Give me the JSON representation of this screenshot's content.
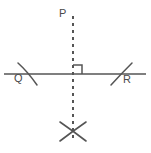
{
  "figure": {
    "background_color": "#ffffff",
    "stroke_color": "#555555",
    "label_color": "#4a4a4a",
    "width": 151,
    "height": 153
  },
  "labels": {
    "point_p": "P",
    "point_q": "Q",
    "point_r": "R"
  },
  "geometry": {
    "base_line": {
      "name": "horizontal-line",
      "x1": 4,
      "y1": 74,
      "x2": 146,
      "y2": 74,
      "style": "solid"
    },
    "perpendicular_line": {
      "name": "vertical-dashed-line",
      "x1": 73,
      "y1": 16,
      "x2": 73,
      "y2": 140,
      "style": "dashed",
      "dash_pattern": "3 4"
    },
    "right_angle_marker": {
      "name": "right-angle-square",
      "x": 73,
      "y": 74,
      "size": 9,
      "orientation": "upper-right"
    },
    "arc_q": {
      "name": "arc-mark-q",
      "x1": 18,
      "y1": 64,
      "x2": 36,
      "y2": 84
    },
    "arc_r": {
      "name": "arc-mark-r",
      "x1": 112,
      "y1": 84,
      "x2": 132,
      "y2": 64
    },
    "cross_arcs": {
      "name": "intersection-cross",
      "arc_a": {
        "x1": 61,
        "y1": 123,
        "x2": 85,
        "y2": 140
      },
      "arc_b": {
        "x1": 61,
        "y1": 140,
        "x2": 85,
        "y2": 123
      }
    },
    "label_positions": {
      "p": {
        "x": 60,
        "y": 16
      },
      "q": {
        "x": 14,
        "y": 81
      },
      "r": {
        "x": 124,
        "y": 82
      }
    }
  }
}
